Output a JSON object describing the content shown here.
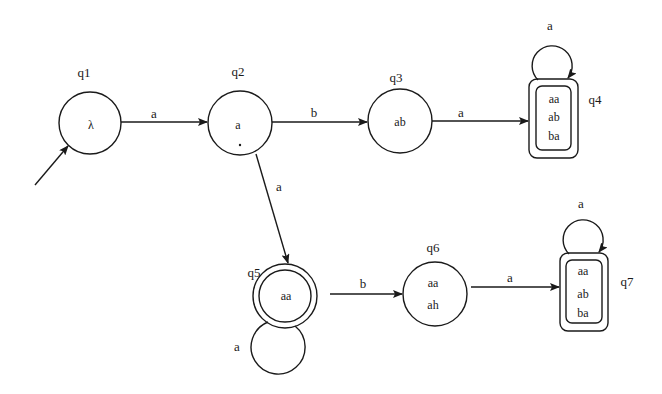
{
  "diagram": {
    "type": "finite-automaton",
    "colors": {
      "stroke": "#1a1a1a",
      "background": "#ffffff"
    },
    "start_state": "q1",
    "states": [
      {
        "id": "q1",
        "name": "q1",
        "contents": [
          "λ"
        ],
        "accepting": false
      },
      {
        "id": "q2",
        "name": "q2",
        "contents": [
          "a",
          "."
        ],
        "accepting": false
      },
      {
        "id": "q3",
        "name": "q3",
        "contents": [
          "ab"
        ],
        "accepting": false
      },
      {
        "id": "q4",
        "name": "q4",
        "contents": [
          "aa",
          "ab",
          "ba"
        ],
        "accepting": true
      },
      {
        "id": "q5",
        "name": "q5",
        "contents": [
          "aa"
        ],
        "accepting": true
      },
      {
        "id": "q6",
        "name": "q6",
        "contents": [
          "aa",
          "ah"
        ],
        "accepting": false
      },
      {
        "id": "q7",
        "name": "q7",
        "contents": [
          "aa",
          "ab",
          "ba"
        ],
        "accepting": true
      }
    ],
    "transitions": [
      {
        "from": "q1",
        "to": "q2",
        "label": "a"
      },
      {
        "from": "q2",
        "to": "q3",
        "label": "b"
      },
      {
        "from": "q3",
        "to": "q4",
        "label": "a"
      },
      {
        "from": "q4",
        "to": "q4",
        "label": "a"
      },
      {
        "from": "q2",
        "to": "q5",
        "label": "a"
      },
      {
        "from": "q5",
        "to": "q5",
        "label": "a"
      },
      {
        "from": "q5",
        "to": "q6",
        "label": "b"
      },
      {
        "from": "q6",
        "to": "q7",
        "label": "a"
      },
      {
        "from": "q7",
        "to": "q7",
        "label": "a"
      }
    ]
  }
}
